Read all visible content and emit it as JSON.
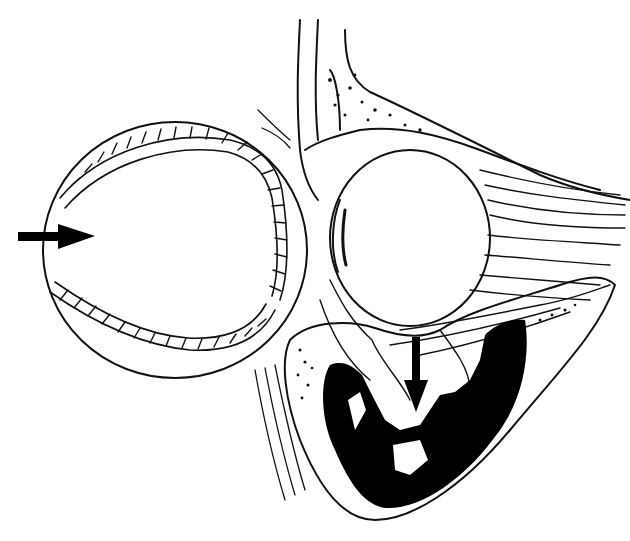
{
  "figure": {
    "colors": {
      "ink": "#111111",
      "background": "#ffffff",
      "sinus_fill": "#000000"
    },
    "elements": [
      {
        "name": "baseball",
        "label": ""
      },
      {
        "name": "impact-arrow",
        "label": ""
      },
      {
        "name": "eyeball",
        "label": ""
      },
      {
        "name": "orbital-roof-bone",
        "label": ""
      },
      {
        "name": "orbital-fat-and-muscles",
        "label": ""
      },
      {
        "name": "maxillary-sinus",
        "label": ""
      },
      {
        "name": "floor-fracture-arrow",
        "label": ""
      }
    ]
  }
}
